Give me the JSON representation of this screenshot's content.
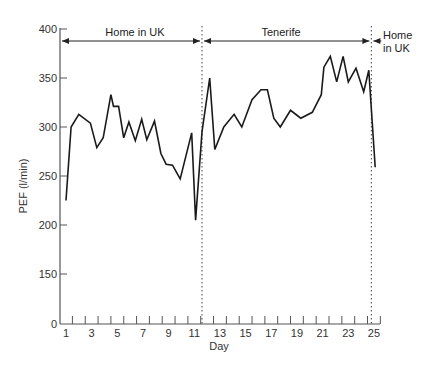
{
  "chart_data": {
    "type": "line",
    "title": "",
    "xlabel": "Day",
    "ylabel": "PEF (l/min)",
    "ylim": [
      0,
      400
    ],
    "xlim": [
      1,
      25
    ],
    "y_axis_break": "scale jumps from 0 to 150 (broken axis)",
    "yticks": [
      "0",
      "150",
      "200",
      "250",
      "300",
      "350",
      "400"
    ],
    "xticks": [
      "1",
      "3",
      "5",
      "7",
      "9",
      "11",
      "13",
      "15",
      "17",
      "19",
      "21",
      "23",
      "25"
    ],
    "grid": false,
    "legend": null,
    "series": [
      {
        "name": "PEF",
        "x": [
          1.0,
          1.4,
          2.0,
          2.9,
          3.4,
          3.9,
          4.5,
          4.7,
          5.1,
          5.5,
          5.9,
          6.4,
          6.9,
          7.3,
          7.9,
          8.4,
          8.8,
          9.3,
          9.9,
          10.8,
          11.1,
          11.6,
          12.2,
          12.6,
          13.3,
          14.1,
          14.7,
          15.5,
          16.2,
          16.7,
          17.2,
          17.7,
          18.5,
          19.3,
          20.2,
          20.9,
          21.1,
          21.6,
          22.1,
          22.6,
          23.0,
          23.6,
          24.2,
          24.6,
          25.1
        ],
        "values": [
          225,
          300,
          313,
          304,
          279,
          289,
          333,
          321,
          321,
          289,
          305,
          286,
          308,
          287,
          306,
          273,
          262,
          261,
          247,
          294,
          205,
          295,
          350,
          277,
          300,
          313,
          300,
          328,
          338,
          338,
          309,
          300,
          317,
          309,
          315,
          333,
          361,
          372,
          346,
          372,
          346,
          360,
          336,
          358,
          259
        ]
      }
    ],
    "annotations": [
      {
        "text": "Home in UK",
        "from_day": 1,
        "to_day": 11.6,
        "type": "double-arrow"
      },
      {
        "text": "Tenerife",
        "from_day": 11.6,
        "to_day": 24.8,
        "type": "double-arrow"
      },
      {
        "text": "Home in UK",
        "from_day": 24.8,
        "type": "left-arrow"
      }
    ],
    "vertical_dividers_day": [
      11.6,
      24.8
    ]
  },
  "labels": {
    "ylabel": "PEF (l/min)",
    "xlabel": "Day",
    "period1": "Home in UK",
    "period2": "Tenerife",
    "period3_line1": "Home",
    "period3_line2": "in UK"
  }
}
